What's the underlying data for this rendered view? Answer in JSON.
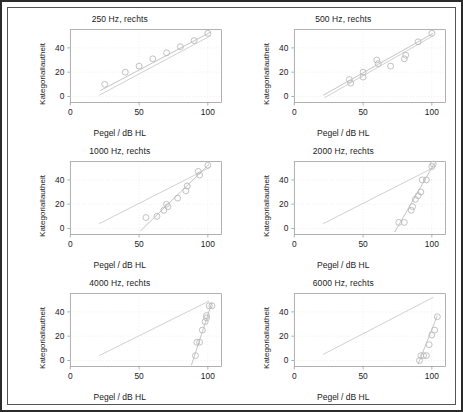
{
  "figure": {
    "axis_labels": {
      "x": "Pegel / dB HL",
      "y": "Kategoriallautheit"
    },
    "xlim": [
      0,
      110
    ],
    "ylim": [
      -5,
      55
    ],
    "xticks": [
      0,
      50,
      100
    ],
    "yticks": [
      0,
      20,
      40
    ],
    "colors": {
      "marker": "#b9b9b9",
      "fit_line": "#c3c3c3",
      "reference_line": "#cfcfcf",
      "axis": "#8d8d8d",
      "grid": "#e2e2e2",
      "text": "#1a1a1a",
      "border": "#2b2b2b"
    }
  },
  "chart_data": [
    {
      "type": "scatter",
      "title": "250 Hz, rechts",
      "xlabel": "Pegel / dB HL",
      "ylabel": "Kategoriallautheit",
      "xlim": [
        0,
        110
      ],
      "ylim": [
        -5,
        55
      ],
      "xticks": [
        0,
        50,
        100
      ],
      "yticks": [
        0,
        20,
        40
      ],
      "grid": true,
      "points": [
        {
          "x": 25,
          "y": 10
        },
        {
          "x": 40,
          "y": 20
        },
        {
          "x": 50,
          "y": 25
        },
        {
          "x": 60,
          "y": 31
        },
        {
          "x": 70,
          "y": 36
        },
        {
          "x": 80,
          "y": 41
        },
        {
          "x": 90,
          "y": 46
        },
        {
          "x": 100,
          "y": 52
        }
      ],
      "fit_line": {
        "x0": 22,
        "y0": 5,
        "x1": 102,
        "y1": 53
      },
      "reference_line": {
        "x0": 21,
        "y0": 1,
        "x1": 102,
        "y1": 50
      }
    },
    {
      "type": "scatter",
      "title": "500 Hz, rechts",
      "xlabel": "Pegel / dB HL",
      "ylabel": "Kategoriallautheit",
      "xlim": [
        0,
        110
      ],
      "ylim": [
        -5,
        55
      ],
      "xticks": [
        0,
        50,
        100
      ],
      "yticks": [
        0,
        20,
        40
      ],
      "grid": true,
      "points": [
        {
          "x": 40,
          "y": 14
        },
        {
          "x": 41,
          "y": 11
        },
        {
          "x": 50,
          "y": 20
        },
        {
          "x": 50,
          "y": 16
        },
        {
          "x": 60,
          "y": 30
        },
        {
          "x": 61,
          "y": 27
        },
        {
          "x": 70,
          "y": 25
        },
        {
          "x": 80,
          "y": 31
        },
        {
          "x": 81,
          "y": 34
        },
        {
          "x": 90,
          "y": 45
        },
        {
          "x": 100,
          "y": 52
        }
      ],
      "fit_line": {
        "x0": 21,
        "y0": 1,
        "x1": 101,
        "y1": 52
      },
      "reference_line": {
        "x0": 22,
        "y0": -1,
        "x1": 101,
        "y1": 50
      }
    },
    {
      "type": "scatter",
      "title": "1000 Hz, rechts",
      "xlabel": "Pegel / dB HL",
      "ylabel": "Kategoriallautheit",
      "xlim": [
        0,
        110
      ],
      "ylim": [
        -5,
        55
      ],
      "xticks": [
        0,
        50,
        100
      ],
      "yticks": [
        0,
        20,
        40
      ],
      "grid": true,
      "points": [
        {
          "x": 55,
          "y": 9
        },
        {
          "x": 63,
          "y": 10
        },
        {
          "x": 68,
          "y": 15
        },
        {
          "x": 70,
          "y": 20
        },
        {
          "x": 71,
          "y": 18
        },
        {
          "x": 78,
          "y": 25
        },
        {
          "x": 84,
          "y": 31
        },
        {
          "x": 85,
          "y": 35
        },
        {
          "x": 93,
          "y": 47
        },
        {
          "x": 94,
          "y": 44
        },
        {
          "x": 100,
          "y": 52
        }
      ],
      "fit_line": {
        "x0": 51,
        "y0": -2,
        "x1": 101,
        "y1": 53
      },
      "reference_line": {
        "x0": 21,
        "y0": 4,
        "x1": 101,
        "y1": 50
      }
    },
    {
      "type": "scatter",
      "title": "2000 Hz, rechts",
      "xlabel": "Pegel / dB HL",
      "ylabel": "Kategoriallautheit",
      "xlim": [
        0,
        110
      ],
      "ylim": [
        -5,
        55
      ],
      "xticks": [
        0,
        50,
        100
      ],
      "yticks": [
        0,
        20,
        40
      ],
      "grid": true,
      "points": [
        {
          "x": 76,
          "y": 5
        },
        {
          "x": 80,
          "y": 5
        },
        {
          "x": 85,
          "y": 15
        },
        {
          "x": 86,
          "y": 18
        },
        {
          "x": 88,
          "y": 24
        },
        {
          "x": 90,
          "y": 27
        },
        {
          "x": 92,
          "y": 30
        },
        {
          "x": 93,
          "y": 40
        },
        {
          "x": 96,
          "y": 40
        },
        {
          "x": 100,
          "y": 51
        },
        {
          "x": 101,
          "y": 53
        }
      ],
      "fit_line": {
        "x0": 73,
        "y0": -3,
        "x1": 102,
        "y1": 54
      },
      "reference_line": {
        "x0": 21,
        "y0": 4,
        "x1": 101,
        "y1": 50
      }
    },
    {
      "type": "scatter",
      "title": "4000 Hz, rechts",
      "xlabel": "Pegel / dB HL",
      "ylabel": "Kategoriallautheit",
      "xlim": [
        0,
        110
      ],
      "ylim": [
        -5,
        55
      ],
      "xticks": [
        0,
        50,
        100
      ],
      "yticks": [
        0,
        20,
        40
      ],
      "grid": true,
      "points": [
        {
          "x": 91,
          "y": 4
        },
        {
          "x": 92,
          "y": 15
        },
        {
          "x": 94,
          "y": 15
        },
        {
          "x": 96,
          "y": 25
        },
        {
          "x": 98,
          "y": 32
        },
        {
          "x": 99,
          "y": 35
        },
        {
          "x": 99,
          "y": 37
        },
        {
          "x": 101,
          "y": 45
        },
        {
          "x": 103,
          "y": 45
        }
      ],
      "fit_line": {
        "x0": 88,
        "y0": -4,
        "x1": 103,
        "y1": 48
      },
      "reference_line": {
        "x0": 21,
        "y0": 4,
        "x1": 101,
        "y1": 49
      }
    },
    {
      "type": "scatter",
      "title": "6000 Hz, rechts",
      "xlabel": "Pegel / dB HL",
      "ylabel": "Kategoriallautheit",
      "xlim": [
        0,
        110
      ],
      "ylim": [
        -5,
        55
      ],
      "xticks": [
        0,
        50,
        100
      ],
      "yticks": [
        0,
        20,
        40
      ],
      "grid": true,
      "points": [
        {
          "x": 91,
          "y": 0
        },
        {
          "x": 92,
          "y": 4
        },
        {
          "x": 94,
          "y": 4
        },
        {
          "x": 96,
          "y": 4
        },
        {
          "x": 98,
          "y": 13
        },
        {
          "x": 100,
          "y": 21
        },
        {
          "x": 102,
          "y": 25
        },
        {
          "x": 104,
          "y": 36
        }
      ],
      "fit_line": {
        "x0": 90,
        "y0": -3,
        "x1": 104,
        "y1": 37
      },
      "reference_line": {
        "x0": 21,
        "y0": 5,
        "x1": 101,
        "y1": 52
      }
    }
  ]
}
